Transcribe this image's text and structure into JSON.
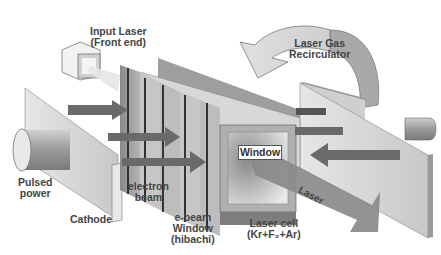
{
  "diagram": {
    "labels": {
      "input_laser": [
        "Input Laser",
        "(Front end)"
      ],
      "gas_recirculator": [
        "Laser Gas",
        "Recirculator"
      ],
      "pulsed_power": [
        "Pulsed",
        "power"
      ],
      "cathode": "Cathode",
      "electron_beam": [
        "electron",
        "beam"
      ],
      "ebeam_window": [
        "e-beam",
        "Window",
        "(hibachi)"
      ],
      "window": "Window",
      "laser_beam": "Laser",
      "laser_cell": [
        "Laser cell",
        "(Kr+F₂+Ar)"
      ]
    },
    "colors": {
      "background": "#ffffff",
      "panel_light": "#d9d9d9",
      "panel_mid": "#a8a8a8",
      "panel_dark": "#6e6e6e",
      "arrow": "#6a6a6a",
      "text": "#444444"
    }
  }
}
